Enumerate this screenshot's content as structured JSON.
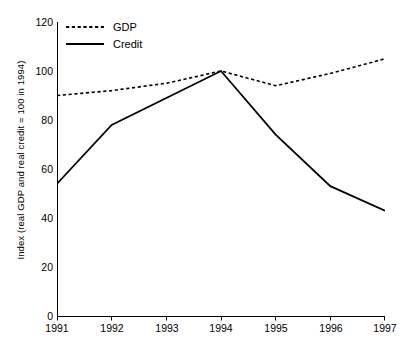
{
  "chart_data": {
    "type": "line",
    "title": "",
    "xlabel": "",
    "ylabel": "Index (real GDP and real credit = 100 in 1994)",
    "x": [
      1991,
      1992,
      1993,
      1994,
      1995,
      1996,
      1997
    ],
    "xticklabels": [
      "1991",
      "1992",
      "1993",
      "1994",
      "1995",
      "1996",
      "1997"
    ],
    "yticks": [
      0,
      20,
      40,
      60,
      80,
      100,
      120
    ],
    "yticklabels": [
      "0",
      "20",
      "40",
      "60",
      "80",
      "100",
      "120"
    ],
    "ylim": [
      0,
      120
    ],
    "xlim": [
      1991,
      1997
    ],
    "grid": false,
    "legend_position": "upper-left",
    "series": [
      {
        "name": "GDP",
        "style": "dotted",
        "color": "#000000",
        "values": [
          90,
          92,
          95,
          100,
          94,
          99,
          105
        ]
      },
      {
        "name": "Credit",
        "style": "solid",
        "color": "#000000",
        "values": [
          54,
          78,
          89,
          100,
          74,
          53,
          43
        ]
      }
    ]
  },
  "axes": {
    "y_title": "Index (real GDP and real credit = 100 in 1994)",
    "y_labels": [
      "120",
      "100",
      "80",
      "60",
      "40",
      "20",
      "0"
    ],
    "x_labels": [
      "1991",
      "1992",
      "1993",
      "1994",
      "1995",
      "1996",
      "1997"
    ]
  },
  "legend": {
    "items": [
      {
        "label": "GDP",
        "style": "dotted"
      },
      {
        "label": "Credit",
        "style": "solid"
      }
    ]
  }
}
